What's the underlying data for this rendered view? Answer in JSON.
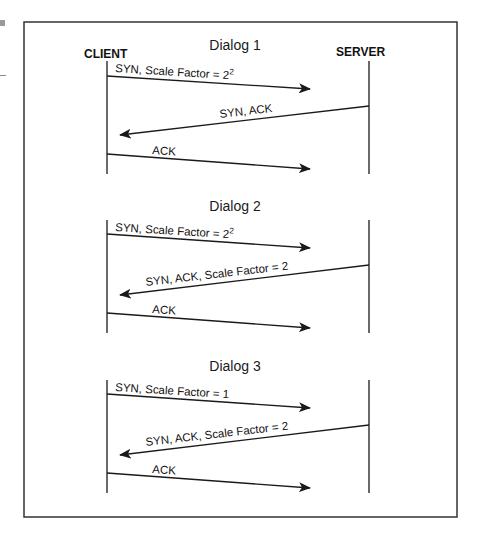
{
  "diagram": {
    "actors": {
      "client": "CLIENT",
      "server": "SERVER"
    },
    "dialogs": [
      {
        "title": "Dialog 1",
        "messages": [
          {
            "label": "SYN, Scale Factor = 2",
            "sup": "2",
            "direction": "client-to-server"
          },
          {
            "label": "SYN, ACK",
            "sup": "",
            "direction": "server-to-client"
          },
          {
            "label": "ACK",
            "sup": "",
            "direction": "client-to-server"
          }
        ]
      },
      {
        "title": "Dialog 2",
        "messages": [
          {
            "label": "SYN, Scale Factor = 2",
            "sup": "2",
            "direction": "client-to-server"
          },
          {
            "label": "SYN, ACK, Scale Factor = 2",
            "sup": "",
            "direction": "server-to-client"
          },
          {
            "label": "ACK",
            "sup": "",
            "direction": "client-to-server"
          }
        ]
      },
      {
        "title": "Dialog 3",
        "messages": [
          {
            "label": "SYN, Scale Factor = 1",
            "sup": "",
            "direction": "client-to-server"
          },
          {
            "label": "SYN, ACK, Scale Factor = 2",
            "sup": "",
            "direction": "server-to-client"
          },
          {
            "label": "ACK",
            "sup": "",
            "direction": "client-to-server"
          }
        ]
      }
    ],
    "colors": {
      "line": "#1a1a1a",
      "border": "#333333",
      "background": "#ffffff"
    }
  }
}
